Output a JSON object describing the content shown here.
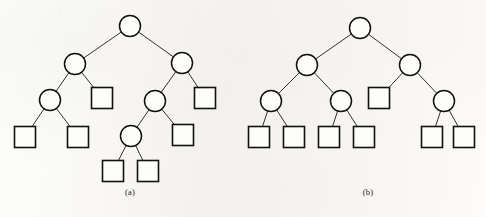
{
  "figure": {
    "background_color": "#fbfaf7",
    "stroke_color": "#111111",
    "node_fill_color": "#fdfdfb",
    "width": 486,
    "height": 217
  },
  "panels": [
    {
      "id": "a",
      "caption": "(a)",
      "caption_x": 130,
      "caption_y": 195,
      "circle_radius": 10.5,
      "square_size": 21,
      "internal_nodes": [
        {
          "name": "a-root",
          "x": 130,
          "y": 26
        },
        {
          "name": "a-n1",
          "x": 75,
          "y": 64
        },
        {
          "name": "a-n2",
          "x": 182,
          "y": 63
        },
        {
          "name": "a-n3",
          "x": 50,
          "y": 100
        },
        {
          "name": "a-n4",
          "x": 155,
          "y": 101
        },
        {
          "name": "a-n5",
          "x": 131,
          "y": 136
        }
      ],
      "leaf_nodes": [
        {
          "name": "a-leaf1",
          "x": 102,
          "y": 98
        },
        {
          "name": "a-leaf2",
          "x": 205,
          "y": 98
        },
        {
          "name": "a-leaf3",
          "x": 25,
          "y": 137
        },
        {
          "name": "a-leaf4",
          "x": 78,
          "y": 137
        },
        {
          "name": "a-leaf5",
          "x": 183,
          "y": 135
        },
        {
          "name": "a-leaf6",
          "x": 113,
          "y": 171
        },
        {
          "name": "a-leaf7",
          "x": 148,
          "y": 171
        }
      ],
      "edges": [
        {
          "from": "a-root",
          "to": "a-n1"
        },
        {
          "from": "a-root",
          "to": "a-n2"
        },
        {
          "from": "a-n1",
          "to": "a-n3"
        },
        {
          "from": "a-n1",
          "to": "a-leaf1"
        },
        {
          "from": "a-n2",
          "to": "a-n4"
        },
        {
          "from": "a-n2",
          "to": "a-leaf2"
        },
        {
          "from": "a-n3",
          "to": "a-leaf3"
        },
        {
          "from": "a-n3",
          "to": "a-leaf4"
        },
        {
          "from": "a-n4",
          "to": "a-n5"
        },
        {
          "from": "a-n4",
          "to": "a-leaf5"
        },
        {
          "from": "a-n5",
          "to": "a-leaf6"
        },
        {
          "from": "a-n5",
          "to": "a-leaf7"
        }
      ]
    },
    {
      "id": "b",
      "caption": "(b)",
      "caption_x": 368,
      "caption_y": 195,
      "circle_radius": 10.5,
      "square_size": 21,
      "internal_nodes": [
        {
          "name": "b-root",
          "x": 360,
          "y": 28
        },
        {
          "name": "b-n1",
          "x": 307,
          "y": 65
        },
        {
          "name": "b-n2",
          "x": 410,
          "y": 65
        },
        {
          "name": "b-n3",
          "x": 271,
          "y": 101
        },
        {
          "name": "b-n4",
          "x": 341,
          "y": 101
        },
        {
          "name": "b-n5",
          "x": 444,
          "y": 101
        }
      ],
      "leaf_nodes": [
        {
          "name": "b-leaf1",
          "x": 379,
          "y": 98
        },
        {
          "name": "b-leaf2",
          "x": 259,
          "y": 137
        },
        {
          "name": "b-leaf3",
          "x": 294,
          "y": 137
        },
        {
          "name": "b-leaf4",
          "x": 329,
          "y": 137
        },
        {
          "name": "b-leaf5",
          "x": 364,
          "y": 137
        },
        {
          "name": "b-leaf6",
          "x": 432,
          "y": 137
        },
        {
          "name": "b-leaf7",
          "x": 464,
          "y": 137
        }
      ],
      "edges": [
        {
          "from": "b-root",
          "to": "b-n1"
        },
        {
          "from": "b-root",
          "to": "b-n2"
        },
        {
          "from": "b-n1",
          "to": "b-n3"
        },
        {
          "from": "b-n1",
          "to": "b-n4"
        },
        {
          "from": "b-n2",
          "to": "b-leaf1"
        },
        {
          "from": "b-n2",
          "to": "b-n5"
        },
        {
          "from": "b-n3",
          "to": "b-leaf2"
        },
        {
          "from": "b-n3",
          "to": "b-leaf3"
        },
        {
          "from": "b-n4",
          "to": "b-leaf4"
        },
        {
          "from": "b-n4",
          "to": "b-leaf5"
        },
        {
          "from": "b-n5",
          "to": "b-leaf6"
        },
        {
          "from": "b-n5",
          "to": "b-leaf7"
        }
      ]
    }
  ],
  "specks": [
    {
      "x": 60,
      "y": 12,
      "r": 0.8
    },
    {
      "x": 228,
      "y": 48,
      "r": 0.7
    },
    {
      "x": 300,
      "y": 22,
      "r": 0.6
    },
    {
      "x": 470,
      "y": 70,
      "r": 0.8
    },
    {
      "x": 20,
      "y": 175,
      "r": 0.7
    },
    {
      "x": 240,
      "y": 160,
      "r": 0.6
    },
    {
      "x": 400,
      "y": 175,
      "r": 0.7
    },
    {
      "x": 160,
      "y": 205,
      "r": 0.6
    }
  ]
}
